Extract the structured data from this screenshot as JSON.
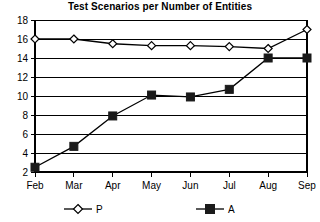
{
  "chart_data": {
    "type": "line",
    "title": "Test Scenarios per Number of Entities",
    "xlabel": "",
    "ylabel": "",
    "categories": [
      "Feb",
      "Mar",
      "Apr",
      "May",
      "Jun",
      "Jul",
      "Aug",
      "Sep"
    ],
    "ylim": [
      2,
      18
    ],
    "yticks": [
      2,
      4,
      6,
      8,
      10,
      12,
      14,
      16,
      18
    ],
    "grid": true,
    "legend_position": "bottom",
    "series": [
      {
        "name": "P",
        "marker": "open-diamond",
        "color": "#000000",
        "values": [
          16,
          16,
          15.5,
          15.3,
          15.3,
          15.2,
          15,
          17
        ]
      },
      {
        "name": "A",
        "marker": "filled-square",
        "color": "#1a1a1a",
        "values": [
          2.5,
          4.7,
          7.9,
          10.1,
          9.9,
          10.7,
          14,
          14
        ]
      }
    ]
  },
  "legend": {
    "items": [
      {
        "label": "P",
        "marker": "open-diamond"
      },
      {
        "label": "A",
        "marker": "filled-square"
      }
    ]
  }
}
